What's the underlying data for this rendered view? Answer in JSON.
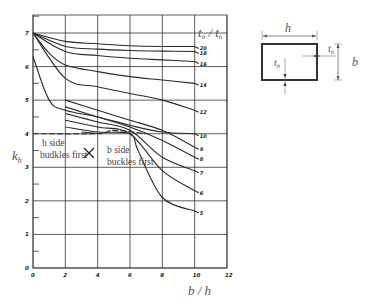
{
  "chart_data": {
    "type": "line",
    "title": "",
    "xlabel": "b / h",
    "ylabel": "k_h",
    "legend_title": "t_b / t_h",
    "xlim": [
      0,
      12
    ],
    "ylim": [
      0,
      7
    ],
    "x_ticks": [
      "0",
      "2",
      "4",
      "6",
      "8",
      "10",
      "12"
    ],
    "y_ticks": [
      "0",
      "1",
      "2",
      "3",
      "4",
      "5",
      "6",
      "7"
    ],
    "grid": true,
    "annotations": [
      "h side buckles first",
      "b side buckles first"
    ],
    "series": [
      {
        "name": "2.0",
        "x": [
          0,
          2,
          4,
          6,
          8,
          10
        ],
        "y": [
          7.0,
          6.75,
          6.68,
          6.62,
          6.6,
          6.6
        ]
      },
      {
        "name": "1.8",
        "x": [
          0,
          2,
          4,
          6,
          8,
          10
        ],
        "y": [
          7.0,
          6.6,
          6.52,
          6.48,
          6.46,
          6.45
        ]
      },
      {
        "name": "1.6",
        "x": [
          0,
          2,
          4,
          6,
          8,
          10
        ],
        "y": [
          7.0,
          6.45,
          6.33,
          6.25,
          6.2,
          6.15
        ]
      },
      {
        "name": "1.4",
        "x": [
          0,
          1,
          2,
          4,
          6,
          8,
          10
        ],
        "y": [
          7.0,
          6.4,
          6.05,
          5.85,
          5.7,
          5.6,
          5.5
        ]
      },
      {
        "name": "1.2",
        "x": [
          0,
          2,
          4,
          6,
          8,
          10
        ],
        "y": [
          7.0,
          5.65,
          5.4,
          5.2,
          5.0,
          4.7
        ]
      },
      {
        "name": "1.0",
        "x": [
          0,
          1,
          2,
          4,
          6,
          8,
          10
        ],
        "y": [
          6.3,
          5.0,
          4.7,
          4.5,
          4.25,
          4.05,
          4.0
        ]
      },
      {
        "name": "0.9",
        "x": [
          2,
          4,
          6,
          8,
          10
        ],
        "y": [
          5.0,
          4.7,
          4.4,
          4.1,
          3.6
        ]
      },
      {
        "name": "0.8",
        "x": [
          2,
          4,
          6,
          8,
          10
        ],
        "y": [
          4.8,
          4.5,
          4.2,
          3.8,
          3.3
        ]
      },
      {
        "name": "0.7",
        "x": [
          2,
          4,
          6,
          8,
          10
        ],
        "y": [
          4.6,
          4.35,
          4.1,
          3.3,
          2.9
        ]
      },
      {
        "name": "0.6",
        "x": [
          2,
          4,
          6,
          8,
          10
        ],
        "y": [
          4.4,
          4.2,
          4.0,
          2.9,
          2.3
        ]
      },
      {
        "name": "0.5",
        "x": [
          2,
          4,
          6,
          6.5,
          8,
          10
        ],
        "y": [
          4.2,
          4.05,
          4.0,
          3.5,
          2.1,
          1.7
        ]
      }
    ],
    "boundary_line": {
      "name": "h/b buckling transition",
      "x": [
        0,
        4,
        5,
        7
      ],
      "y": [
        4.0,
        4.0,
        4.1,
        4.0
      ]
    }
  },
  "diagram": {
    "width_label": "h",
    "height_label": "b",
    "thickness_side_label": "t_b",
    "thickness_bottom_label": "t_h"
  }
}
